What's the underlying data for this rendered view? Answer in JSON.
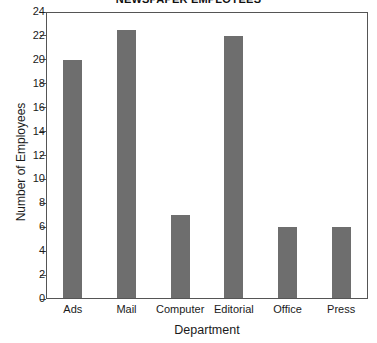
{
  "chart_data": {
    "type": "bar",
    "title": "NEWSPAPER EMPLOYEES",
    "xlabel": "Department",
    "ylabel": "Number of Employees",
    "categories": [
      "Ads",
      "Mail",
      "Computer",
      "Editorial",
      "Office",
      "Press"
    ],
    "values": [
      20,
      22.5,
      7,
      22,
      6,
      6
    ],
    "ylim": [
      0,
      24
    ],
    "ytick_step": 2,
    "yticks": [
      0,
      2,
      4,
      6,
      8,
      10,
      12,
      14,
      16,
      18,
      20,
      22,
      24
    ],
    "ytick_labels": [
      "0",
      "2",
      "4",
      "6",
      "8",
      "10",
      "12",
      "14",
      "16",
      "18",
      "20",
      "22",
      "24"
    ],
    "grid": false,
    "legend": false,
    "legend_position": "none",
    "bar_color": "#6e6e6e",
    "frame_color": "#555555",
    "background_color": "#ffffff"
  }
}
